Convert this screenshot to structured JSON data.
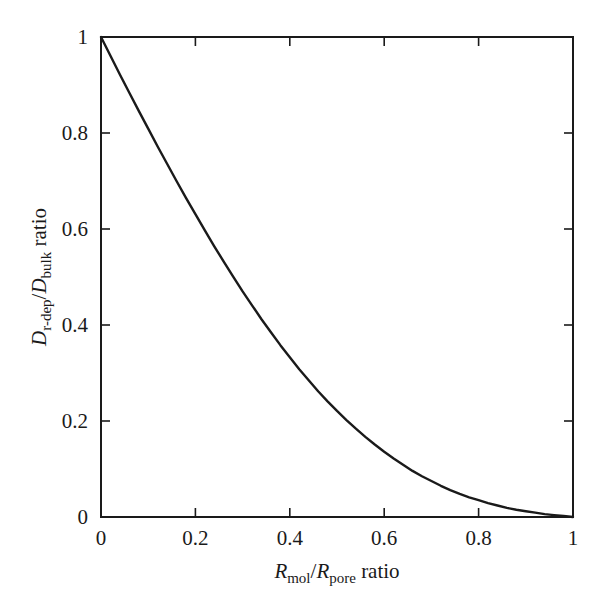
{
  "figure": {
    "background_color": "#ffffff",
    "frame_color": "#1a1a1a",
    "line_color": "#1a1a1a"
  },
  "axes": {
    "x": {
      "title_main": "R",
      "title_sub": "mol",
      "title_sep": "/",
      "title_main2": "R",
      "title_sub2": "pore",
      "title_tail": " ratio",
      "tick_labels": [
        "0",
        "0.2",
        "0.4",
        "0.6",
        "0.8",
        "1"
      ],
      "tick_values": [
        0,
        0.2,
        0.4,
        0.6,
        0.8,
        1
      ],
      "range": [
        0,
        1
      ]
    },
    "y": {
      "title_main": "D",
      "title_sub": "r-dep",
      "title_sep": "/",
      "title_main2": "D",
      "title_sub2": "bulk",
      "title_tail": " ratio",
      "tick_labels": [
        "0",
        "0.2",
        "0.4",
        "0.6",
        "0.8",
        "1"
      ],
      "tick_values": [
        0,
        0.2,
        0.4,
        0.6,
        0.8,
        1
      ],
      "range": [
        0,
        1
      ]
    }
  },
  "chart_data": {
    "type": "line",
    "title": "",
    "xlabel": "R_mol/R_pore ratio",
    "ylabel": "D_r-dep/D_bulk ratio",
    "xlim": [
      0,
      1
    ],
    "ylim": [
      0,
      1
    ],
    "grid": false,
    "legend": false,
    "series": [
      {
        "name": "hindered diffusion ratio",
        "x": [
          0.0,
          0.02,
          0.04,
          0.06,
          0.08,
          0.1,
          0.12,
          0.14,
          0.16,
          0.18,
          0.2,
          0.22,
          0.24,
          0.26,
          0.28,
          0.3,
          0.32,
          0.34,
          0.36,
          0.38,
          0.4,
          0.42,
          0.44,
          0.46,
          0.48,
          0.5,
          0.52,
          0.54,
          0.56,
          0.58,
          0.6,
          0.62,
          0.64,
          0.66,
          0.68,
          0.7,
          0.72,
          0.74,
          0.76,
          0.78,
          0.8,
          0.82,
          0.84,
          0.86,
          0.88,
          0.9,
          0.92,
          0.94,
          0.96,
          0.98,
          1.0
        ],
        "y": [
          1.0,
          0.961,
          0.922,
          0.884,
          0.846,
          0.809,
          0.772,
          0.736,
          0.7,
          0.665,
          0.631,
          0.597,
          0.564,
          0.532,
          0.501,
          0.47,
          0.441,
          0.412,
          0.385,
          0.358,
          0.333,
          0.308,
          0.285,
          0.262,
          0.241,
          0.221,
          0.202,
          0.184,
          0.167,
          0.151,
          0.136,
          0.122,
          0.109,
          0.096,
          0.085,
          0.075,
          0.065,
          0.056,
          0.048,
          0.041,
          0.035,
          0.029,
          0.024,
          0.019,
          0.015,
          0.012,
          0.009,
          0.006,
          0.004,
          0.002,
          0.0
        ]
      }
    ]
  }
}
